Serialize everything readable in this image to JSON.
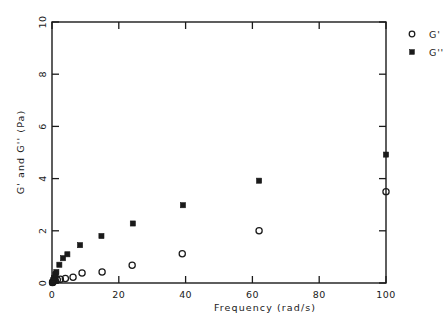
{
  "chart_data": {
    "type": "scatter",
    "title": "",
    "xlabel": "Frequency (rad/s)",
    "ylabel": "G' and G'' (Pa)",
    "xlim": [
      0,
      100
    ],
    "ylim": [
      0,
      10
    ],
    "xticks": [
      0,
      20,
      40,
      60,
      80,
      100
    ],
    "yticks": [
      0,
      2,
      4,
      6,
      8,
      10
    ],
    "xtick_labels": [
      "0",
      "20",
      "40",
      "60",
      "80",
      "100"
    ],
    "ytick_labels": [
      "0",
      "2",
      "4",
      "6",
      "8",
      "10"
    ],
    "grid": false,
    "legend_position": "outside right top",
    "series": [
      {
        "name": "G'",
        "marker": "open-circle",
        "color": "#1a1a1a",
        "points": [
          {
            "x": 0.15,
            "y": 0.02
          },
          {
            "x": 0.25,
            "y": 0.05
          },
          {
            "x": 0.4,
            "y": 0.06
          },
          {
            "x": 0.63,
            "y": 0.08
          },
          {
            "x": 1.0,
            "y": 0.1
          },
          {
            "x": 1.6,
            "y": 0.12
          },
          {
            "x": 2.5,
            "y": 0.14
          },
          {
            "x": 4.0,
            "y": 0.17
          },
          {
            "x": 6.3,
            "y": 0.22
          },
          {
            "x": 9.0,
            "y": 0.38
          },
          {
            "x": 15.0,
            "y": 0.42
          },
          {
            "x": 24.0,
            "y": 0.68
          },
          {
            "x": 39.0,
            "y": 1.12
          },
          {
            "x": 62.0,
            "y": 2.0
          },
          {
            "x": 100.0,
            "y": 3.5
          }
        ]
      },
      {
        "name": "G''",
        "marker": "filled-square",
        "color": "#1a1a1a",
        "points": [
          {
            "x": 0.15,
            "y": 0.0
          },
          {
            "x": 0.25,
            "y": 0.05
          },
          {
            "x": 0.4,
            "y": 0.12
          },
          {
            "x": 0.63,
            "y": 0.2
          },
          {
            "x": 1.0,
            "y": 0.3
          },
          {
            "x": 1.1,
            "y": 0.35
          },
          {
            "x": 1.3,
            "y": 0.42
          },
          {
            "x": 2.2,
            "y": 0.7
          },
          {
            "x": 3.3,
            "y": 0.95
          },
          {
            "x": 4.6,
            "y": 1.1
          },
          {
            "x": 8.4,
            "y": 1.45
          },
          {
            "x": 14.8,
            "y": 1.8
          },
          {
            "x": 24.2,
            "y": 2.28
          },
          {
            "x": 39.2,
            "y": 2.98
          },
          {
            "x": 62.0,
            "y": 3.92
          },
          {
            "x": 100.0,
            "y": 4.92
          }
        ]
      }
    ],
    "legend": [
      {
        "label": "G'",
        "marker": "open-circle"
      },
      {
        "label": "G''",
        "marker": "filled-square"
      }
    ]
  }
}
